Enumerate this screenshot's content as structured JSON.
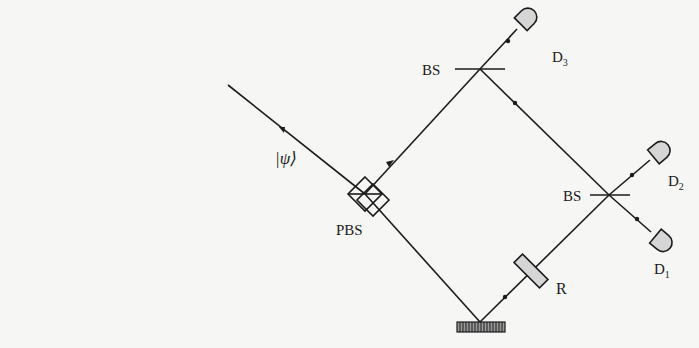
{
  "diagram": {
    "type": "optical interferometer setup",
    "input_state": "|ψ⟩",
    "components": {
      "pbs": {
        "label": "PBS"
      },
      "bs_top": {
        "label": "BS"
      },
      "bs_right": {
        "label": "BS"
      },
      "retarder": {
        "label": "R"
      },
      "mirror": {
        "label": ""
      },
      "detectors": [
        {
          "id": "D3",
          "label": "D",
          "sub": "3"
        },
        {
          "id": "D2",
          "label": "D",
          "sub": "2"
        },
        {
          "id": "D1",
          "label": "D",
          "sub": "1"
        }
      ]
    },
    "colors": {
      "line": "#1c1c1c",
      "detector_fill": "#d6d6d6",
      "background": "#f6f6f4"
    }
  }
}
